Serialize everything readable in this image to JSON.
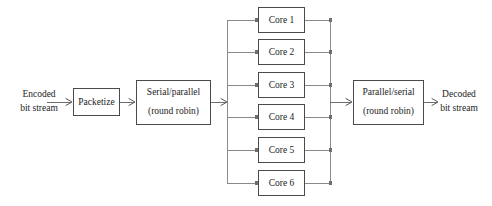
{
  "diagram": {
    "type": "block-diagram",
    "canvas": {
      "width": 492,
      "height": 206,
      "background": "#ffffff"
    },
    "colors": {
      "box_stroke": "#4a4a4a",
      "box_fill": "#ffffff",
      "wire": "#6e6e6e",
      "bus": "#8a8a8a",
      "text": "#1c1c1c"
    },
    "input": {
      "line1": "Encoded",
      "line2": "bit stream",
      "x": 39,
      "y": 102
    },
    "output": {
      "line1": "Decoded",
      "line2": "bit stream",
      "x": 459,
      "y": 102
    },
    "blocks": [
      {
        "id": "packetize",
        "label_lines": [
          "Packetize"
        ],
        "x": 73,
        "y": 88,
        "width": 47,
        "height": 28
      },
      {
        "id": "serial-parallel",
        "label_lines": [
          "Serial/parallel",
          "(round robin)"
        ],
        "x": 136,
        "y": 80,
        "width": 75,
        "height": 45
      },
      {
        "id": "parallel-serial",
        "label_lines": [
          "Parallel/serial",
          "(round robin)"
        ],
        "x": 353,
        "y": 80,
        "width": 71,
        "height": 45
      }
    ],
    "cores": [
      {
        "id": "core-1",
        "label": "Core 1",
        "x": 258,
        "y": 7,
        "width": 47,
        "height": 26,
        "center_y": 20
      },
      {
        "id": "core-2",
        "label": "Core 2",
        "x": 258,
        "y": 39,
        "width": 47,
        "height": 26,
        "center_y": 52
      },
      {
        "id": "core-3",
        "label": "Core 3",
        "x": 258,
        "y": 72,
        "width": 47,
        "height": 26,
        "center_y": 85
      },
      {
        "id": "core-4",
        "label": "Core 4",
        "x": 258,
        "y": 104,
        "width": 47,
        "height": 26,
        "center_y": 117
      },
      {
        "id": "core-5",
        "label": "Core 5",
        "x": 258,
        "y": 137,
        "width": 47,
        "height": 26,
        "center_y": 150
      },
      {
        "id": "core-6",
        "label": "Core 6",
        "x": 258,
        "y": 170,
        "width": 47,
        "height": 26,
        "center_y": 183
      }
    ],
    "buses": {
      "fan_out_x": 227,
      "fan_in_x": 330,
      "top_y": 20,
      "bottom_y": 183,
      "main_y": 102
    },
    "connections": [
      {
        "from": "encoded-bit-stream",
        "to": "packetize"
      },
      {
        "from": "packetize",
        "to": "serial-parallel"
      },
      {
        "from": "serial-parallel",
        "to": "fan-out-bus"
      },
      {
        "from": "fan-out-bus",
        "to": "core-1"
      },
      {
        "from": "fan-out-bus",
        "to": "core-2"
      },
      {
        "from": "fan-out-bus",
        "to": "core-3"
      },
      {
        "from": "fan-out-bus",
        "to": "core-4"
      },
      {
        "from": "fan-out-bus",
        "to": "core-5"
      },
      {
        "from": "fan-out-bus",
        "to": "core-6"
      },
      {
        "from": "core-1",
        "to": "fan-in-bus"
      },
      {
        "from": "core-2",
        "to": "fan-in-bus"
      },
      {
        "from": "core-3",
        "to": "fan-in-bus"
      },
      {
        "from": "core-4",
        "to": "fan-in-bus"
      },
      {
        "from": "core-5",
        "to": "fan-in-bus"
      },
      {
        "from": "core-6",
        "to": "fan-in-bus"
      },
      {
        "from": "fan-in-bus",
        "to": "parallel-serial"
      },
      {
        "from": "parallel-serial",
        "to": "decoded-bit-stream"
      }
    ]
  }
}
